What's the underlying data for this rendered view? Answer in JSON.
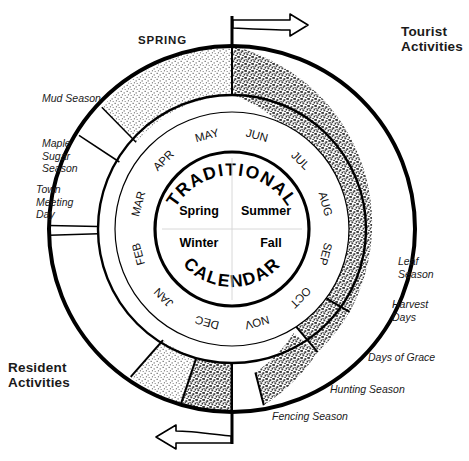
{
  "title": "TRADITIONAL CALENDAR",
  "center": {
    "arc_top": "TRADITIONAL",
    "arc_bottom": "CALENDAR",
    "quadrants": [
      {
        "name": "spring",
        "label": "Spring"
      },
      {
        "name": "summer",
        "label": "Summer"
      },
      {
        "name": "winter",
        "label": "Winter"
      },
      {
        "name": "fall",
        "label": "Fall"
      }
    ]
  },
  "month_ring": {
    "months": [
      {
        "key": "jun",
        "label": "JUN"
      },
      {
        "key": "jul",
        "label": "JUL"
      },
      {
        "key": "aug",
        "label": "AUG"
      },
      {
        "key": "sep",
        "label": "SEP"
      },
      {
        "key": "oct",
        "label": "OCT"
      },
      {
        "key": "nov",
        "label": "NOV"
      },
      {
        "key": "dec",
        "label": "DEC"
      },
      {
        "key": "jan",
        "label": "JAN"
      },
      {
        "key": "feb",
        "label": "FEB"
      },
      {
        "key": "mar",
        "label": "MAR"
      },
      {
        "key": "apr",
        "label": "APR"
      },
      {
        "key": "may",
        "label": "MAY"
      }
    ]
  },
  "corners": {
    "tourist": "Tourist\nActivities",
    "resident": "Resident\nActivities",
    "spring_marker": "SPRING"
  },
  "outer_ring": {
    "sectors": [
      {
        "key": "tourist-summer",
        "label": "",
        "fill": "dark",
        "start": -90,
        "end": 50
      },
      {
        "key": "leaf-season",
        "label": "Leaf Season",
        "fill": "dark",
        "start": 50,
        "end": 62
      },
      {
        "key": "harvest-days",
        "label": "Harvest Days",
        "fill": "dark",
        "start": 62,
        "end": 80
      },
      {
        "key": "days-of-grace",
        "label": "Days of Grace",
        "fill": "white",
        "start": 80,
        "end": 100
      },
      {
        "key": "hunting-season",
        "label": "Hunting Season",
        "fill": "dark",
        "start": 100,
        "end": 118
      },
      {
        "key": "fencing-season",
        "label": "Fencing Season",
        "fill": "light",
        "start": 118,
        "end": 152
      },
      {
        "key": "resident-winter",
        "label": "",
        "fill": "white",
        "start": 152,
        "end": 228
      },
      {
        "key": "town-meeting-day",
        "label": "Town Meeting Day",
        "fill": "white",
        "start": 228,
        "end": 232
      },
      {
        "key": "maple-sugar-season",
        "label": "Maple Sugar Season",
        "fill": "white",
        "start": 232,
        "end": 255
      },
      {
        "key": "mud-season",
        "label": "Mud Season",
        "fill": "white",
        "start": 255,
        "end": 266
      },
      {
        "key": "spring-stipple",
        "label": "",
        "fill": "light",
        "start": 266,
        "end": 270
      }
    ]
  },
  "edge_labels": {
    "mud_season": "Mud Season",
    "maple_sugar_season": "Maple\nSugar\nSeason",
    "town_meeting_day": "Town\nMeeting\nDay",
    "leaf_season": "Leaf\nSeason",
    "harvest_days": "Harvest\nDays",
    "days_of_grace": "Days of Grace",
    "hunting_season": "Hunting Season",
    "fencing_season": "Fencing Season"
  },
  "arrows": {
    "top": {
      "name": "clockwise-arrow-right",
      "direction": "right"
    },
    "bottom": {
      "name": "counterclockwise-arrow-left",
      "direction": "left"
    }
  },
  "colors": {
    "ink": "#000000",
    "paper": "#ffffff",
    "dark_stipple": "#8a8a8a",
    "light_stipple": "#e2e2e2"
  }
}
